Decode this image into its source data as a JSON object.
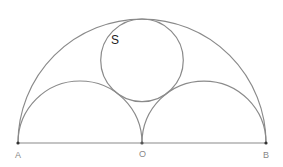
{
  "diagram": {
    "type": "arbelos-like geometry figure",
    "stroke_color": "#8a8a8a",
    "point_color": "#333333",
    "points": {
      "A": {
        "label": "A",
        "x": 18,
        "y": 143
      },
      "O": {
        "label": "O",
        "x": 142,
        "y": 143
      },
      "B": {
        "label": "B",
        "x": 266,
        "y": 143
      }
    },
    "large_semicircle": {
      "cx": 142,
      "cy": 143,
      "r": 124
    },
    "small_semicircles": [
      {
        "cx": 80,
        "cy": 143,
        "r": 62
      },
      {
        "cx": 204,
        "cy": 143,
        "r": 62
      }
    ],
    "inscribed_circle": {
      "label": "S",
      "cx": 142,
      "cy": 60.3,
      "r": 41.3
    }
  }
}
